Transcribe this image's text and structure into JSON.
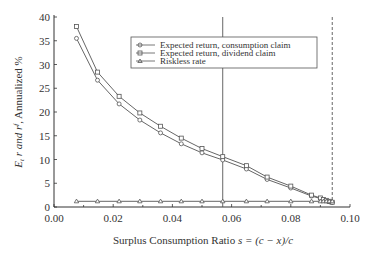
{
  "chart_data": {
    "type": "line",
    "title": "",
    "xlabel": "Surplus Consumption Ratio s = (c − x)/c",
    "ylabel": "E_t r and r^f, Annualized %",
    "xlim": [
      0.0,
      0.1
    ],
    "ylim": [
      0,
      40
    ],
    "x_ticks": [
      "0.00",
      "0.02",
      "0.04",
      "0.06",
      "0.08",
      "0.10"
    ],
    "y_ticks": [
      "0",
      "5",
      "10",
      "15",
      "20",
      "25",
      "30",
      "35",
      "40"
    ],
    "grid": false,
    "legend_position": "upper right (inside)",
    "x": [
      0.0076,
      0.0147,
      0.022,
      0.029,
      0.036,
      0.043,
      0.05,
      0.057,
      0.065,
      0.072,
      0.08,
      0.087,
      0.09,
      0.091,
      0.092,
      0.093,
      0.094
    ],
    "series": [
      {
        "name": "Expected return, consumption claim",
        "marker": "circle",
        "values": [
          35.5,
          26.7,
          21.7,
          18.3,
          15.6,
          13.3,
          11.4,
          9.9,
          8.0,
          5.8,
          4.0,
          2.3,
          1.8,
          1.5,
          1.3,
          1.1,
          1.0
        ]
      },
      {
        "name": "Expected return, dividend claim",
        "marker": "square",
        "values": [
          38.0,
          28.4,
          23.3,
          19.8,
          17.0,
          14.5,
          12.3,
          10.6,
          8.7,
          6.3,
          4.4,
          2.5,
          1.9,
          1.6,
          1.4,
          1.2,
          1.0
        ]
      },
      {
        "name": "Riskless rate",
        "marker": "triangle",
        "values": [
          1.2,
          1.2,
          1.2,
          1.2,
          1.2,
          1.2,
          1.2,
          1.2,
          1.2,
          1.2,
          1.2,
          1.2,
          1.2,
          1.2,
          1.2,
          1.2,
          1.2
        ]
      }
    ],
    "annotations": [
      {
        "type": "vertical_line",
        "style": "solid",
        "x": 0.057
      },
      {
        "type": "vertical_line",
        "style": "dashed",
        "x": 0.094
      }
    ]
  },
  "legend": {
    "items": [
      "Expected return, consumption claim",
      "Expected return, dividend claim",
      "Riskless rate"
    ]
  },
  "axes": {
    "xlabel_prefix": "Surplus Consumption Ratio ",
    "xlabel_formula": "s = (c − x)/c",
    "ylabel_main": "E",
    "ylabel_sub": "t",
    "ylabel_mid": " r and r",
    "ylabel_sup": "f",
    "ylabel_tail": ", Annualized %"
  },
  "colors": {
    "line": "#555555",
    "axis": "#333333",
    "text": "#333333"
  }
}
